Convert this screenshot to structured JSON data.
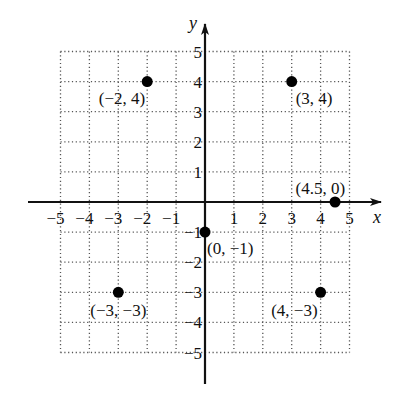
{
  "chart_data": {
    "type": "scatter",
    "title": "",
    "xlabel": "x",
    "ylabel": "y",
    "xlim": [
      -5,
      5
    ],
    "ylim": [
      -5,
      5
    ],
    "grid": true,
    "x_ticks": [
      "−5",
      "−4",
      "−3",
      "−2",
      "−1",
      "1",
      "2",
      "3",
      "4",
      "5"
    ],
    "y_ticks": [
      "5",
      "4",
      "3",
      "2",
      "1",
      "−1",
      "−2",
      "−3",
      "−4",
      "−5"
    ],
    "points": [
      {
        "x": -2,
        "y": 4,
        "label": "(−2, 4)"
      },
      {
        "x": 3,
        "y": 4,
        "label": "(3, 4)"
      },
      {
        "x": 4.5,
        "y": 0,
        "label": "(4.5, 0)"
      },
      {
        "x": 0,
        "y": -1,
        "label": "(0, −1)"
      },
      {
        "x": -3,
        "y": -3,
        "label": "(−3, −3)"
      },
      {
        "x": 4,
        "y": -3,
        "label": "(4, −3)"
      }
    ]
  }
}
